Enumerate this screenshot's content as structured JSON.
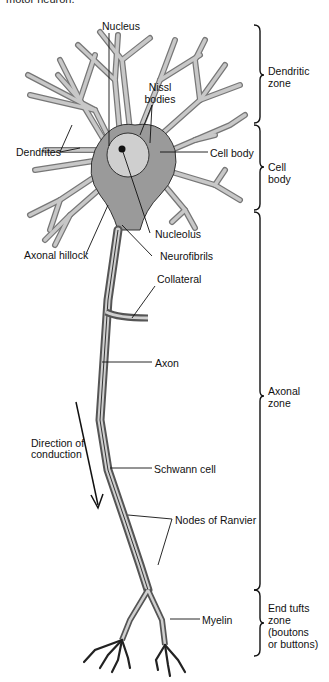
{
  "caption": "motor neuron.",
  "labels": {
    "nucleus": "Nucleus",
    "nissl_1": "Nissl",
    "nissl_2": "bodies",
    "dendrites": "Dendrites",
    "cell_body": "Cell body",
    "nucleolus": "Nucleolus",
    "axonal_hillock": "Axonal hillock",
    "neurofibrils": "Neurofibrils",
    "collateral": "Collateral",
    "axon": "Axon",
    "direction_1": "Direction of",
    "direction_2": "conduction",
    "schwann_cell": "Schwann cell",
    "nodes_of_ranvier": "Nodes of Ranvier",
    "myelin": "Myelin"
  },
  "zones": [
    {
      "line1": "Dendritic",
      "line2": "zone"
    },
    {
      "line1": "Cell",
      "line2": "body"
    },
    {
      "line1": "Axonal",
      "line2": "zone"
    },
    {
      "line1": "End tufts",
      "line2": "zone",
      "line3": "(boutons",
      "line4": "or buttons)"
    }
  ],
  "colors": {
    "ink": "#111111",
    "cell_fill": "#9a9a9a",
    "dendrite_fill": "#b8b8b8",
    "axon_fill": "#a8a8a8"
  }
}
